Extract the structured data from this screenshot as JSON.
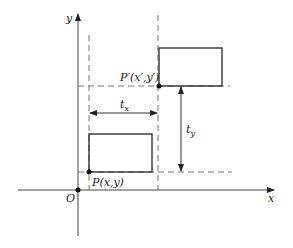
{
  "diagram": {
    "axes": {
      "x_label": "x",
      "y_label": "y",
      "origin_label": "O"
    },
    "points": {
      "p": {
        "label": "P(x,y)"
      },
      "p_prime": {
        "label": "P′(x′,y′)"
      }
    },
    "vectors": {
      "tx": {
        "label": "t",
        "subscript": "x"
      },
      "ty": {
        "label": "t",
        "subscript": "y"
      }
    },
    "colors": {
      "line": "#333333",
      "dashed": "#777777",
      "point": "#111111"
    }
  }
}
